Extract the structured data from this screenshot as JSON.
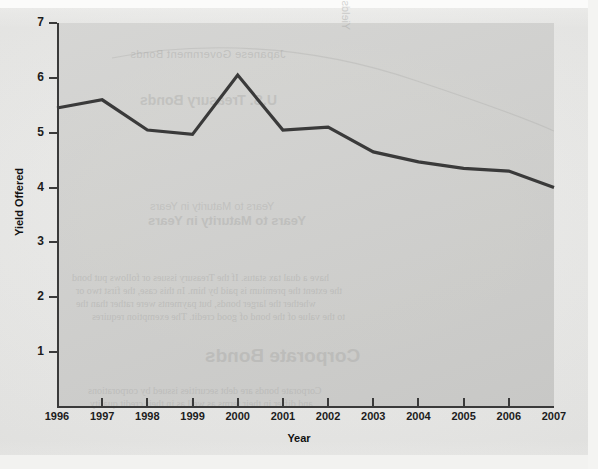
{
  "chart_data": {
    "type": "line",
    "title": "",
    "xlabel": "Year",
    "ylabel": "Yield Offered",
    "x": [
      1996,
      1997,
      1998,
      1999,
      2000,
      2001,
      2002,
      2003,
      2004,
      2005,
      2006,
      2007
    ],
    "categories": [
      "1996",
      "1997",
      "1998",
      "1999",
      "2000",
      "2001",
      "2002",
      "2003",
      "2004",
      "2005",
      "2006",
      "2007"
    ],
    "values": [
      5.45,
      5.6,
      5.05,
      4.97,
      6.05,
      5.05,
      5.1,
      4.65,
      4.47,
      4.35,
      4.3,
      4.0
    ],
    "series": [
      {
        "name": "Yield Offered",
        "values": [
          5.45,
          5.6,
          5.05,
          4.97,
          6.05,
          5.05,
          5.1,
          4.65,
          4.47,
          4.35,
          4.3,
          4.0
        ]
      }
    ],
    "ylim": [
      0,
      7
    ],
    "yticks": [
      1,
      2,
      3,
      4,
      5,
      6,
      7
    ],
    "ytick_labels": [
      "1",
      "2",
      "3",
      "4",
      "5",
      "6",
      "7"
    ],
    "xlim": [
      1996,
      2007
    ],
    "grid": false,
    "legend": false,
    "legend_position": "none",
    "line_color": "#3a3a3a",
    "plot_background": "#cfcfcd",
    "figure_background": "#e8e8e6"
  },
  "axes": {
    "y_title": "Yield Offered",
    "x_title": "Year",
    "y_ticks": [
      {
        "label": "7",
        "value": 7
      },
      {
        "label": "6",
        "value": 6
      },
      {
        "label": "5",
        "value": 5
      },
      {
        "label": "4",
        "value": 4
      },
      {
        "label": "3",
        "value": 3
      },
      {
        "label": "2",
        "value": 2
      },
      {
        "label": "1",
        "value": 1
      }
    ],
    "x_ticks": [
      {
        "label": "1996"
      },
      {
        "label": "1997"
      },
      {
        "label": "1998"
      },
      {
        "label": "1999"
      },
      {
        "label": "2000"
      },
      {
        "label": "2001"
      },
      {
        "label": "2002"
      },
      {
        "label": "2003"
      },
      {
        "label": "2004"
      },
      {
        "label": "2005"
      },
      {
        "label": "2006"
      },
      {
        "label": "2007"
      }
    ]
  },
  "showthrough": {
    "note": "faint mirrored text bleeding through from the reverse side of the scanned page",
    "lines": [
      "Japanese Government Bonds",
      "Japanese Government Bonds",
      "U.S. Treasury Bonds",
      "U.S. Treasury Bonds",
      "Years to Maturity in Years",
      "Years to Maturity in Years",
      "Yields on Government Bonds",
      "have a dual tax status. If the Treasury issues or follows put bond",
      "the extent the premium is paid by him. In this case, the first two or",
      "whether the larger bonds, but payments were rather than the",
      "to the value of the bond of good credit. The exemption requires",
      "Corporate Bonds",
      "Corporate bonds are debt securities issued by corporations",
      "and differ in their terms as well as in their credit quality"
    ]
  }
}
